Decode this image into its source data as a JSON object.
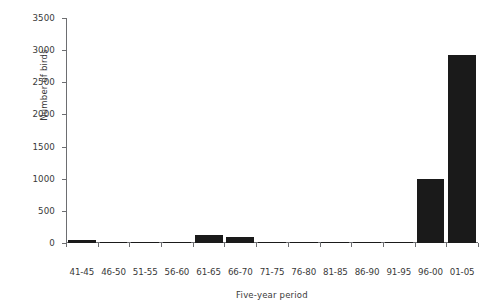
{
  "chart_data": {
    "type": "bar",
    "title": "",
    "xlabel": "Five-year period",
    "ylabel": "Number of birds",
    "categories": [
      "41-45",
      "46-50",
      "51-55",
      "56-60",
      "61-65",
      "66-70",
      "71-75",
      "76-80",
      "81-85",
      "86-90",
      "91-95",
      "96-00",
      "01-05"
    ],
    "values": [
      50,
      20,
      5,
      5,
      125,
      90,
      15,
      10,
      5,
      20,
      15,
      1000,
      2920
    ],
    "ylim": [
      0,
      3500
    ],
    "yticks": [
      0,
      500,
      1000,
      1500,
      2000,
      2500,
      3000,
      3500
    ],
    "ytick_labels": [
      "0",
      "500",
      "1000",
      "1500",
      "2000",
      "2500",
      "3000",
      "3500"
    ],
    "grid": false,
    "legend": false,
    "bar_color": "#1a1a1a",
    "axis_color": "#6d6e71"
  }
}
